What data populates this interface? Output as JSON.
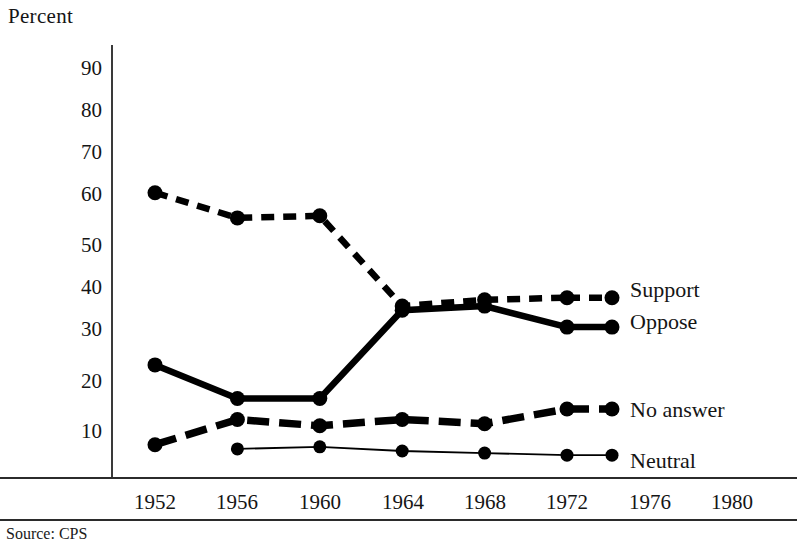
{
  "chart_data": {
    "type": "line",
    "title": "",
    "ylabel": "Percent",
    "xlabel": "",
    "ylim": [
      0,
      95
    ],
    "yticks": [
      10,
      20,
      30,
      40,
      50,
      60,
      70,
      80,
      90
    ],
    "x": [
      1952,
      1956,
      1960,
      1964,
      1968,
      1972,
      1976,
      1980
    ],
    "xticks": [
      "1952",
      "1956",
      "1960",
      "1964",
      "1968",
      "1972",
      "1976",
      "1980"
    ],
    "grid": false,
    "legend_position": "right-inline-at-line-end",
    "series": [
      {
        "name": "Support",
        "label": "Support",
        "style": "dashed-bold",
        "color": "#000000",
        "x": [
          1952,
          1956,
          1960,
          1964,
          1968,
          1972
        ],
        "values": [
          66.5,
          60.5,
          61,
          39.5,
          41,
          41.5
        ]
      },
      {
        "name": "Oppose",
        "label": "Oppose",
        "style": "solid-bold",
        "color": "#000000",
        "x": [
          1952,
          1956,
          1960,
          1964,
          1968,
          1972
        ],
        "values": [
          25.5,
          17.5,
          17.5,
          38.5,
          39.5,
          34.5
        ]
      },
      {
        "name": "No answer",
        "label": "No answer",
        "style": "long-dashed-bold",
        "color": "#000000",
        "x": [
          1952,
          1956,
          1960,
          1964,
          1968,
          1972
        ],
        "values": [
          6.5,
          12.5,
          11,
          12.5,
          11.5,
          15
        ]
      },
      {
        "name": "Neutral",
        "label": "Neutral",
        "style": "solid-thin",
        "color": "#000000",
        "x": [
          1956,
          1960,
          1964,
          1968,
          1972
        ],
        "values": [
          5.5,
          6,
          5,
          4.5,
          4
        ]
      }
    ],
    "annotations": []
  },
  "axis": {
    "ylabel_text": "Percent",
    "yticks": [
      "90",
      "80",
      "70",
      "60",
      "50",
      "40",
      "30",
      "20",
      "10"
    ],
    "xticks": [
      "1952",
      "1956",
      "1960",
      "1964",
      "1968",
      "1972",
      "1976",
      "1980"
    ]
  },
  "legend": {
    "items": [
      {
        "label": "Support"
      },
      {
        "label": "Oppose"
      },
      {
        "label": "No answer"
      },
      {
        "label": "Neutral"
      }
    ]
  },
  "footer": {
    "source": "Source: CPS"
  },
  "colors": {
    "ink": "#151515",
    "line": "#000000",
    "rule": "#2b2b2b",
    "background": "#ffffff"
  }
}
